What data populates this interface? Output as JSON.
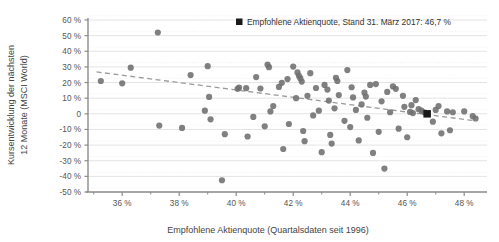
{
  "chart_data": {
    "type": "scatter",
    "title": "",
    "xlabel": "Empfohlene Aktienquote (Quartalsdaten seit 1996)",
    "ylabel": "Kursentwicklung der nächsten\n12 Monate (MSCI World)",
    "ylabel_line1": "Kursentwicklung der nächsten",
    "ylabel_line2": "12 Monate (MSCI World)",
    "xlim": [
      34.8,
      48.8
    ],
    "ylim": [
      -50,
      60
    ],
    "grid": true,
    "x_tick_labels": [
      "36 %",
      "38 %",
      "40 %",
      "42 %",
      "44 %",
      "46 %",
      "48 %"
    ],
    "x_tick_values": [
      36,
      38,
      40,
      42,
      44,
      46,
      48
    ],
    "x_minor_tick_values": [
      35,
      37,
      39,
      41,
      43,
      45,
      47
    ],
    "y_tick_labels": [
      "60 %",
      "50 %",
      "40 %",
      "30 %",
      "20 %",
      "10 %",
      "0",
      "-10 %",
      "-20 %",
      "-30 %",
      "-40 %",
      "-50 %"
    ],
    "y_tick_values": [
      60,
      50,
      40,
      30,
      20,
      10,
      0,
      -10,
      -20,
      -30,
      -40,
      -50
    ],
    "marker_color": "#6e6e6e",
    "highlight_color": "#1a1a1a",
    "trend_color": "#9a9a9a",
    "axis_color": "#8c8c8c",
    "grid_color": "#e4e4e4",
    "legend": {
      "position": "top-right",
      "marker": "square",
      "label": "Empfohlene Aktienquote, Stand 31. März 2017: 46,7 %"
    },
    "trendline": {
      "type": "linear-dashed",
      "x_start": 35.1,
      "y_start": 26.8,
      "x_end": 48.4,
      "y_end": -4.5
    },
    "highlight_point": {
      "x": 46.7,
      "y": 0.0,
      "label": "Empfohlene Aktienquote, Stand 31. März 2017: 46,7 %"
    },
    "points": [
      [
        35.25,
        21.0
      ],
      [
        36.0,
        19.5
      ],
      [
        36.3,
        29.5
      ],
      [
        37.25,
        52.0
      ],
      [
        37.3,
        -7.5
      ],
      [
        38.1,
        -9.0
      ],
      [
        38.4,
        24.8
      ],
      [
        39.0,
        30.5
      ],
      [
        39.05,
        10.8
      ],
      [
        39.1,
        -3.5
      ],
      [
        39.5,
        -42.5
      ],
      [
        39.6,
        -13.0
      ],
      [
        40.05,
        16.0
      ],
      [
        40.1,
        16.8
      ],
      [
        40.35,
        16.4
      ],
      [
        40.4,
        -14.5
      ],
      [
        40.6,
        -2.0
      ],
      [
        40.85,
        16.2
      ],
      [
        41.0,
        -8.0
      ],
      [
        41.1,
        31.5
      ],
      [
        41.15,
        29.8
      ],
      [
        41.2,
        1.5
      ],
      [
        41.5,
        17.2
      ],
      [
        41.6,
        19.8
      ],
      [
        41.65,
        -22.5
      ],
      [
        41.8,
        22.2
      ],
      [
        41.85,
        -6.5
      ],
      [
        42.0,
        30.2
      ],
      [
        42.1,
        10.0
      ],
      [
        42.15,
        26.5
      ],
      [
        42.2,
        24.3
      ],
      [
        42.25,
        22.8
      ],
      [
        42.3,
        20.6
      ],
      [
        42.35,
        -11.0
      ],
      [
        42.4,
        -17.5
      ],
      [
        42.5,
        11.5
      ],
      [
        42.6,
        26.0
      ],
      [
        42.7,
        -1.0
      ],
      [
        42.9,
        2.0
      ],
      [
        43.0,
        -24.5
      ],
      [
        43.1,
        18.5
      ],
      [
        43.2,
        15.5
      ],
      [
        43.25,
        8.5
      ],
      [
        43.3,
        -13.5
      ],
      [
        43.35,
        -19.0
      ],
      [
        43.5,
        23.0
      ],
      [
        43.55,
        21.0
      ],
      [
        43.6,
        12.0
      ],
      [
        43.8,
        -4.5
      ],
      [
        43.9,
        28.0
      ],
      [
        44.0,
        -8.5
      ],
      [
        44.05,
        17.0
      ],
      [
        44.1,
        10.5
      ],
      [
        44.2,
        2.5
      ],
      [
        44.3,
        -17.0
      ],
      [
        44.4,
        6.0
      ],
      [
        44.5,
        13.5
      ],
      [
        44.55,
        11.0
      ],
      [
        44.6,
        -2.5
      ],
      [
        44.8,
        -25.0
      ],
      [
        44.9,
        19.0
      ],
      [
        45.0,
        -11.5
      ],
      [
        45.1,
        8.0
      ],
      [
        45.2,
        -35.0
      ],
      [
        45.3,
        14.0
      ],
      [
        45.4,
        1.0
      ],
      [
        45.5,
        17.5
      ],
      [
        45.6,
        16.0
      ],
      [
        45.7,
        -9.5
      ],
      [
        45.9,
        4.5
      ],
      [
        46.0,
        -15.0
      ],
      [
        46.1,
        1.2
      ],
      [
        46.2,
        0.5
      ],
      [
        46.3,
        8.8
      ],
      [
        46.4,
        3.0
      ],
      [
        46.5,
        2.0
      ],
      [
        46.6,
        1.0
      ],
      [
        46.7,
        0.0
      ],
      [
        46.9,
        -5.0
      ],
      [
        47.0,
        2.5
      ],
      [
        47.1,
        5.0
      ],
      [
        47.2,
        -12.5
      ],
      [
        47.4,
        1.5
      ],
      [
        47.5,
        -10.5
      ],
      [
        47.6,
        1.0
      ],
      [
        48.0,
        1.5
      ],
      [
        48.3,
        -1.5
      ],
      [
        48.4,
        -3.0
      ],
      [
        41.3,
        5.0
      ],
      [
        42.8,
        16.5
      ],
      [
        43.45,
        3.5
      ],
      [
        44.7,
        18.5
      ],
      [
        45.85,
        11.5
      ],
      [
        46.15,
        5.5
      ],
      [
        40.7,
        23.5
      ],
      [
        38.9,
        2.0
      ]
    ]
  }
}
